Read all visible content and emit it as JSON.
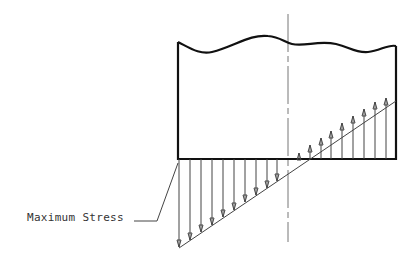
{
  "diagram": {
    "annotations": {
      "max_stress_label": "Maximum Stress"
    },
    "colors": {
      "outline": "#111111",
      "arrows": "#444444",
      "centerline": "#666666",
      "text": "#333333"
    },
    "elements": [
      "wavy-top-break-line",
      "section-outline",
      "neutral-axis-centerline",
      "compression-stress-arrows",
      "tension-stress-arrows",
      "stress-distribution-line",
      "maximum-stress-leader"
    ]
  }
}
